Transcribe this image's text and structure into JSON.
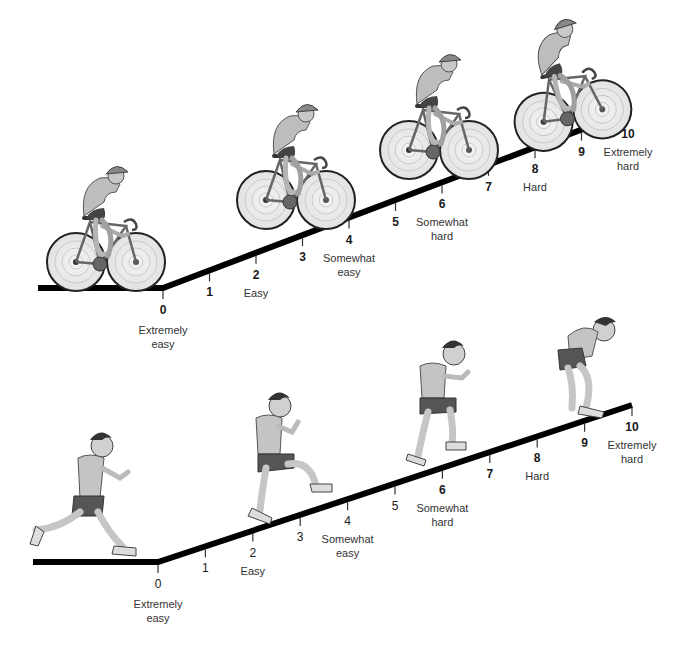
{
  "colors": {
    "ramp": "#000000",
    "text": "#1a1a1a",
    "figure_fill": "#bdbdbd",
    "figure_dark": "#555555"
  },
  "scales": [
    {
      "activity": "cycling",
      "ticks": [
        {
          "value": "0",
          "label": [
            "Extremely",
            "easy"
          ],
          "bold": true
        },
        {
          "value": "1",
          "label": [],
          "bold": true
        },
        {
          "value": "2",
          "label": [
            "Easy"
          ],
          "bold": true
        },
        {
          "value": "3",
          "label": [],
          "bold": true
        },
        {
          "value": "4",
          "label": [
            "Somewhat",
            "easy"
          ],
          "bold": true
        },
        {
          "value": "5",
          "label": [],
          "bold": true
        },
        {
          "value": "6",
          "label": [
            "Somewhat",
            "hard"
          ],
          "bold": true
        },
        {
          "value": "7",
          "label": [],
          "bold": true
        },
        {
          "value": "8",
          "label": [
            "Hard"
          ],
          "bold": true
        },
        {
          "value": "9",
          "label": [],
          "bold": true
        },
        {
          "value": "10",
          "label": [
            "Extremely",
            "hard"
          ],
          "bold": true
        }
      ],
      "figures": [
        "cyclist-easy",
        "cyclist-moderate",
        "cyclist-somewhat-hard",
        "cyclist-hard"
      ]
    },
    {
      "activity": "running",
      "ticks": [
        {
          "value": "0",
          "label": [
            "Extremely",
            "easy"
          ],
          "bold": false
        },
        {
          "value": "1",
          "label": [],
          "bold": false
        },
        {
          "value": "2",
          "label": [
            "Easy"
          ],
          "bold": false
        },
        {
          "value": "3",
          "label": [],
          "bold": false
        },
        {
          "value": "4",
          "label": [
            "Somewhat",
            "easy"
          ],
          "bold": false
        },
        {
          "value": "5",
          "label": [],
          "bold": false
        },
        {
          "value": "6",
          "label": [
            "Somewhat",
            "hard"
          ],
          "bold": true
        },
        {
          "value": "7",
          "label": [],
          "bold": true
        },
        {
          "value": "8",
          "label": [
            "Hard"
          ],
          "bold": true
        },
        {
          "value": "9",
          "label": [],
          "bold": true
        },
        {
          "value": "10",
          "label": [
            "Extremely",
            "hard"
          ],
          "bold": true
        }
      ],
      "figures": [
        "runner-jogging",
        "runner-climbing",
        "runner-striding",
        "runner-exhausted"
      ]
    }
  ]
}
